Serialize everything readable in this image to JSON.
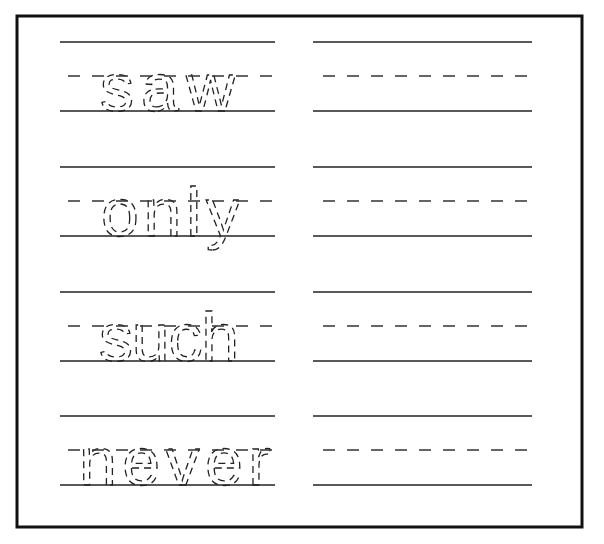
{
  "worksheet": {
    "title": "Sight word tracing practice",
    "rows": [
      {
        "word": "saw",
        "trace_column": "dotted tracing",
        "practice_column": "blank"
      },
      {
        "word": "only",
        "trace_column": "dotted tracing",
        "practice_column": "blank"
      },
      {
        "word": "such",
        "trace_column": "dotted tracing",
        "practice_column": "blank"
      },
      {
        "word": "never",
        "trace_column": "dotted tracing",
        "practice_column": "blank"
      }
    ],
    "colors": {
      "ink": "#222222",
      "background": "#ffffff"
    }
  }
}
